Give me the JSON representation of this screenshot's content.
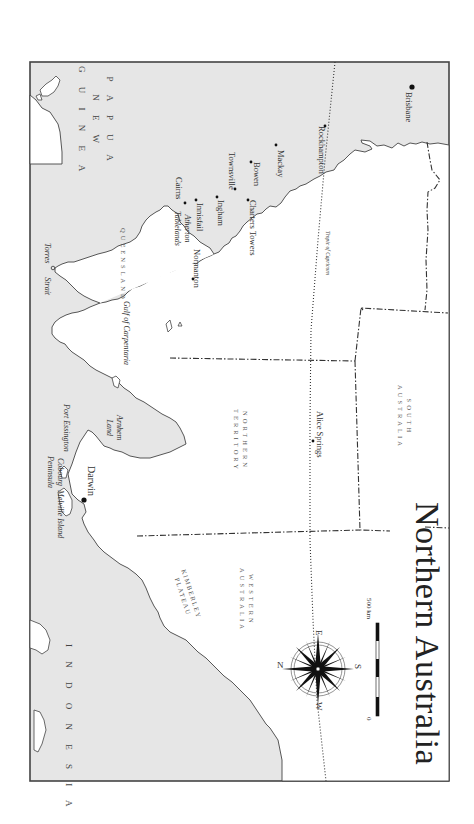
{
  "map": {
    "title": "Northern Australia",
    "orientation": "rotated 90° clockwise (north points left)",
    "colors": {
      "sea": "#e6e6e6",
      "land": "#ffffff",
      "frame": "#444444",
      "coast": "#444444",
      "border": "#333333"
    },
    "countries": {
      "png_line1": "P A P U A",
      "png_line2": "N E W",
      "png_line3": "G U I N E A",
      "indonesia": "I N D O N E S I A"
    },
    "states": {
      "queensland": "QUEENSLAND",
      "nt_line1": "NORTHERN",
      "nt_line2": "TERRITORY",
      "wa_line1": "WESTERN",
      "wa_line2": "AUSTRALIA",
      "sa_line1": "SOUTH",
      "sa_line2": "AUSTRALIA"
    },
    "regions": {
      "kimberley_line1": "KIMBERLEY",
      "kimberley_line2": "PLATEAU",
      "arnhem_line1": "Arnhem",
      "arnhem_line2": "Land",
      "atherton_line1": "Atherton",
      "atherton_line2": "Tablelands",
      "cobourg_line1": "Cobourg",
      "cobourg_line2": "Peninsula"
    },
    "water": {
      "torres": "Torres",
      "strait": "Strait",
      "gulf": "Gulf of Carpentaria",
      "tropic": "Tropic of Capricorn"
    },
    "places": {
      "cairns": "Cairns",
      "innisfail": "Innisfail",
      "ingham": "Ingham",
      "townsville": "Townsville",
      "bowen": "Bowen",
      "mackay": "Mackay",
      "rockhampton": "Rockhampton",
      "brisbane": "Brisbane",
      "charters_towers": "Charters Towers",
      "normanton": "Normanton",
      "darwin": "Darwin",
      "port_essington": "Port Essington",
      "melville_island": "Melville Island",
      "alice_springs": "Alice Springs"
    },
    "compass": {
      "n": "N",
      "e": "E",
      "s": "S",
      "w": "W"
    },
    "scale": {
      "start": "0",
      "end": "500 km"
    }
  }
}
